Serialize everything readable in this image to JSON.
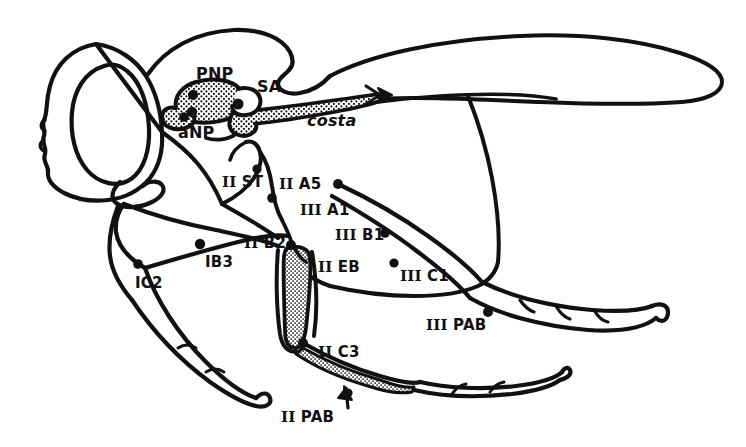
{
  "figure": {
    "type": "scientific-line-drawing",
    "background_color": "#ffffff",
    "ink_color": "#111111",
    "stipple_color": "#111111"
  },
  "labels": [
    {
      "id": "pnp",
      "text": "PNP",
      "roman": "",
      "style": "plain",
      "x": 196,
      "y": 66,
      "size": "lg"
    },
    {
      "id": "sa",
      "text": "SA",
      "roman": "",
      "style": "plain",
      "x": 257,
      "y": 79,
      "size": "lg"
    },
    {
      "id": "anp",
      "text": "aNP",
      "roman": "",
      "style": "plain",
      "x": 178,
      "y": 125,
      "size": "lg"
    },
    {
      "id": "costa",
      "text": "costa",
      "roman": "",
      "style": "italic",
      "x": 307,
      "y": 113,
      "size": "lg"
    },
    {
      "id": "ii_st",
      "text": "ST",
      "roman": "II",
      "style": "roman",
      "x": 222,
      "y": 175,
      "size": "md"
    },
    {
      "id": "ii_a5",
      "text": "A5",
      "roman": "II",
      "style": "roman",
      "x": 279,
      "y": 177,
      "size": "md"
    },
    {
      "id": "iii_a1",
      "text": "A1",
      "roman": "III",
      "style": "roman",
      "x": 300,
      "y": 203,
      "size": "md"
    },
    {
      "id": "iii_b1",
      "text": "B1",
      "roman": "III",
      "style": "roman",
      "x": 335,
      "y": 228,
      "size": "md"
    },
    {
      "id": "ii_b2",
      "text": "B2",
      "roman": "II",
      "style": "roman",
      "x": 244,
      "y": 236,
      "size": "md"
    },
    {
      "id": "ii_eb",
      "text": "EB",
      "roman": "II",
      "style": "roman",
      "x": 318,
      "y": 260,
      "size": "md"
    },
    {
      "id": "ib3",
      "text": "IB3",
      "roman": "",
      "style": "plain",
      "x": 205,
      "y": 255,
      "size": "md"
    },
    {
      "id": "ic2",
      "text": "IC2",
      "roman": "",
      "style": "plain",
      "x": 135,
      "y": 276,
      "size": "md"
    },
    {
      "id": "iii_c1",
      "text": "C1",
      "roman": "III",
      "style": "roman",
      "x": 400,
      "y": 269,
      "size": "md"
    },
    {
      "id": "iii_pab",
      "text": "PAB",
      "roman": "III",
      "style": "roman",
      "x": 426,
      "y": 318,
      "size": "md"
    },
    {
      "id": "ii_c3",
      "text": "C3",
      "roman": "II",
      "style": "roman",
      "x": 318,
      "y": 345,
      "size": "md"
    },
    {
      "id": "ii_pab",
      "text": "PAB",
      "roman": "II",
      "style": "roman",
      "x": 281,
      "y": 410,
      "size": "md"
    }
  ],
  "attachment_points": [
    {
      "id": "pt-pnp-a",
      "x": 193,
      "y": 95,
      "r": 5.0
    },
    {
      "id": "pt-pnp-b",
      "x": 192,
      "y": 112,
      "r": 5.2
    },
    {
      "id": "pt-sa",
      "x": 238,
      "y": 104,
      "r": 5.5
    },
    {
      "id": "pt-anp",
      "x": 184,
      "y": 117,
      "r": 4.8
    },
    {
      "id": "pt-ii-st",
      "x": 257,
      "y": 169,
      "r": 4.6
    },
    {
      "id": "pt-ii-a5",
      "x": 272,
      "y": 198,
      "r": 4.8
    },
    {
      "id": "pt-iii-a1",
      "x": 338,
      "y": 184,
      "r": 5.0
    },
    {
      "id": "pt-iii-b1",
      "x": 385,
      "y": 233,
      "r": 4.8
    },
    {
      "id": "pt-ii-b2",
      "x": 291,
      "y": 245,
      "r": 5.0
    },
    {
      "id": "pt-ib3",
      "x": 200,
      "y": 244,
      "r": 5.2
    },
    {
      "id": "pt-ic2",
      "x": 138,
      "y": 264,
      "r": 4.8
    },
    {
      "id": "pt-iii-c1",
      "x": 394,
      "y": 263,
      "r": 4.6
    },
    {
      "id": "pt-iii-pab",
      "x": 488,
      "y": 312,
      "r": 5.0
    },
    {
      "id": "pt-ii-c3",
      "x": 303,
      "y": 343,
      "r": 5.0
    },
    {
      "id": "pt-ii-pab",
      "x": 348,
      "y": 393,
      "r": 4.6
    }
  ]
}
